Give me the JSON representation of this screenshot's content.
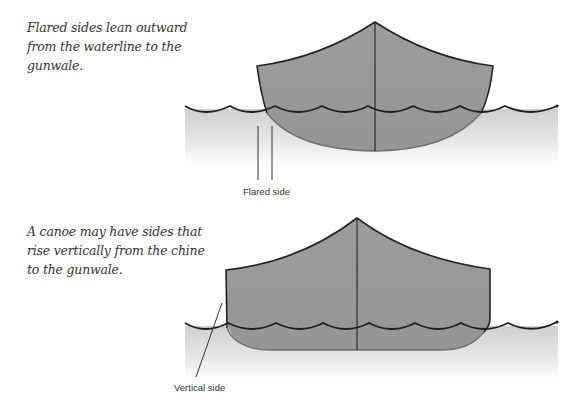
{
  "diagrams": [
    {
      "caption": "Flared sides lean outward from the waterline to the gunwale.",
      "label": "Flared side",
      "side_type": "flared"
    },
    {
      "caption": "A canoe may have sides that rise vertically from the chine to the gunwale.",
      "label": "Vertical side",
      "side_type": "vertical"
    }
  ],
  "colors": {
    "hull_fill": "#9a9a9a",
    "hull_stroke": "#222222",
    "submerged_stroke": "#6e6e6e",
    "water_top": "#cfcfcf",
    "water_bottom": "#ffffff",
    "text": "#333333"
  }
}
